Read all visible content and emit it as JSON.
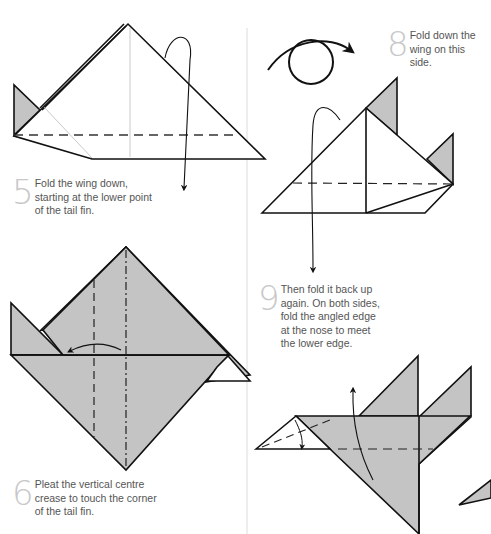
{
  "page": {
    "background": "#ffffff",
    "divider_color": "#dcdcdc",
    "paper_color": "#c4c4c4",
    "line_color": "#111111",
    "step_number_color": "#c8c8c8",
    "text_color": "#555555"
  },
  "steps": [
    {
      "number": "5",
      "lines": [
        "Fold the wing down,",
        "starting at the lower point",
        "of the tail fin."
      ]
    },
    {
      "number": "6",
      "lines": [
        "Pleat the vertical centre",
        "crease to touch the corner",
        "of the tail fin."
      ]
    },
    {
      "number": "8",
      "lines": [
        "Fold down the",
        "wing on this",
        "side."
      ]
    },
    {
      "number": "9",
      "lines": [
        "Then fold it back up",
        "again. On both sides,",
        "fold the angled edge",
        "at the nose to meet",
        "the lower edge."
      ]
    }
  ],
  "icons": {
    "turn_over": "turn-over-arrow-icon",
    "fold_arrow": "fold-arrow-icon"
  }
}
